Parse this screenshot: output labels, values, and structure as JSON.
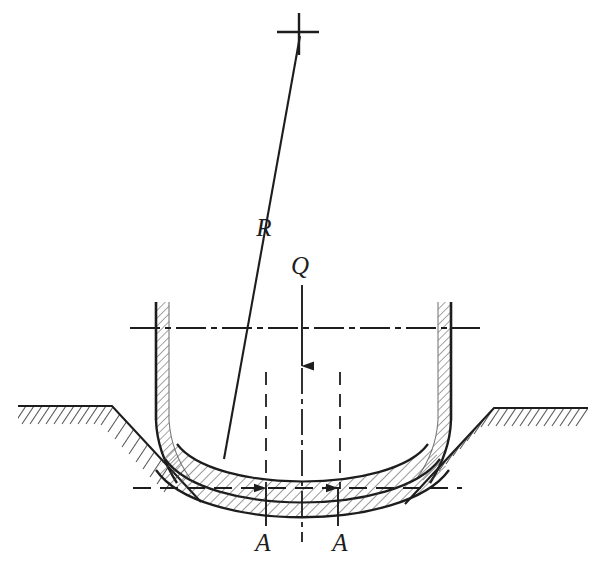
{
  "figure": {
    "background_color": "#ffffff",
    "line_color": "#1d1d1d",
    "hatch_color": "#4a4a4a",
    "width": 606,
    "height": 563
  },
  "labels": {
    "resultant": "R",
    "load": "Q",
    "reaction_left": "A",
    "reaction_right": "A"
  },
  "label_positions": {
    "resultant": {
      "x": 264,
      "y": 236
    },
    "load": {
      "x": 300,
      "y": 274
    },
    "reaction_left": {
      "x": 263,
      "y": 545
    },
    "reaction_right": {
      "x": 340,
      "y": 545
    }
  },
  "markers": {
    "cross_top": {
      "x": 298,
      "y": 32,
      "arm": 19,
      "name": "cross-marker"
    }
  },
  "vectors": {
    "resultant_line": {
      "name": "R",
      "x1": 300,
      "y1": 36,
      "x2": 224,
      "y2": 459,
      "style": "solid"
    },
    "load_arrow": {
      "name": "Q",
      "x1": 302,
      "y1": 285,
      "x2": 302,
      "y2": 365,
      "style": "solid",
      "arrowhead_y": 365
    },
    "load_axis_dashdot": {
      "x": 302,
      "y1": 365,
      "y2": 540,
      "style": "dash-dot"
    },
    "reaction_left_arrow": {
      "name": "A",
      "x1": 266,
      "y1": 525,
      "x2": 266,
      "y2": 487,
      "style": "solid"
    },
    "reaction_right_arrow": {
      "name": "A",
      "x1": 338,
      "y1": 525,
      "x2": 338,
      "y2": 487,
      "style": "solid"
    }
  },
  "guides": {
    "horizontal_centerline": {
      "x1": 130,
      "x2": 480,
      "y": 328,
      "style": "dash-dot"
    },
    "horizontal_datum": {
      "x1": 133,
      "x2": 462,
      "y": 488,
      "style": "dashed"
    },
    "vertical_dashed_left": {
      "x": 266,
      "y1": 372,
      "y2": 489,
      "style": "dashed"
    },
    "vertical_dashed_right": {
      "x": 340,
      "y1": 372,
      "y2": 489,
      "style": "dashed"
    }
  },
  "geometry": {
    "bucket_wall_left_x": 155,
    "bucket_wall_right_x": 452,
    "bucket_wall_top_y": 302,
    "bucket_wall_thickness": 13,
    "ground_left_y": 406,
    "ground_right_y": 408,
    "arc_outer_depth_y": 519,
    "arc_mid_depth_y": 499,
    "arc_inner_depth_y": 484
  },
  "elements": [
    {
      "name": "ground-line-left",
      "type": "hatched-boundary"
    },
    {
      "name": "ground-line-right",
      "type": "hatched-boundary"
    },
    {
      "name": "bucket-wall-left",
      "type": "hatched-wall"
    },
    {
      "name": "bucket-wall-right",
      "type": "hatched-wall"
    },
    {
      "name": "soil-band-upper",
      "type": "hatched-crescent"
    },
    {
      "name": "soil-band-lower",
      "type": "hatched-crescent"
    }
  ]
}
